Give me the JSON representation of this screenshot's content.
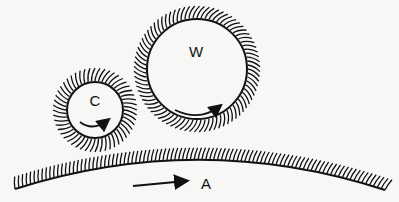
{
  "diagram": {
    "title": "",
    "colors": {
      "ink": "#111111",
      "background": "#f7f7f5"
    },
    "elements": [
      {
        "id": "C",
        "label": "C",
        "kind": "roller",
        "rotation": "clockwise"
      },
      {
        "id": "W",
        "label": "W",
        "kind": "roller",
        "rotation": "clockwise"
      },
      {
        "id": "A",
        "label": "A",
        "kind": "curved-surface",
        "motion": "rightward"
      }
    ]
  }
}
